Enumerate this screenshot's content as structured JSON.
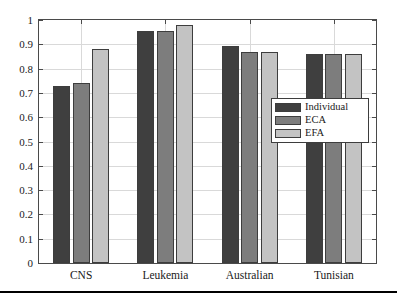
{
  "chart_data": {
    "type": "bar",
    "title": "",
    "xlabel": "",
    "ylabel": "",
    "categories": [
      "CNS",
      "Leukemia",
      "Australian",
      "Tunisian"
    ],
    "series": [
      {
        "name": "Individual",
        "color": "#3f3f3f",
        "values": [
          0.727,
          0.955,
          0.893,
          0.862
        ]
      },
      {
        "name": "ECA",
        "color": "#7d7d7d",
        "values": [
          0.74,
          0.955,
          0.868,
          0.862
        ]
      },
      {
        "name": "EFA",
        "color": "#c3c3c3",
        "values": [
          0.88,
          0.978,
          0.868,
          0.862
        ]
      }
    ],
    "ylim": [
      0,
      1
    ],
    "yticks": [
      0,
      0.1,
      0.2,
      0.3,
      0.4,
      0.5,
      0.6,
      0.7,
      0.8,
      0.9,
      1
    ],
    "yticklabels": [
      "0",
      "0.1",
      "0.2",
      "0.3",
      "0.4",
      "0.5",
      "0.6",
      "0.7",
      "0.8",
      "0.9",
      "1"
    ],
    "grid": true,
    "legend_position": "center-right",
    "bar_edge_color": "#3d3d3d",
    "axes_color": "#4a4a4a",
    "grid_color": "#d9d9d9"
  },
  "legend": {
    "entries": [
      {
        "label": "Individual"
      },
      {
        "label": "ECA"
      },
      {
        "label": "EFA"
      }
    ]
  }
}
